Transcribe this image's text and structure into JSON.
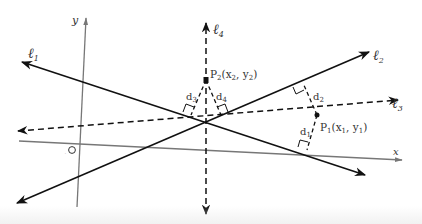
{
  "diagram": {
    "axes": {
      "x_label": "x",
      "y_label": "y",
      "origin_label": "O"
    },
    "lines": [
      {
        "id": "l1",
        "label": "ℓ",
        "sub": "1",
        "style": "solid"
      },
      {
        "id": "l2",
        "label": "ℓ",
        "sub": "2",
        "style": "solid"
      },
      {
        "id": "l3",
        "label": "ℓ",
        "sub": "3",
        "style": "dashed"
      },
      {
        "id": "l4",
        "label": "ℓ",
        "sub": "4",
        "style": "dashed"
      }
    ],
    "points": [
      {
        "id": "P1",
        "name": "P",
        "sub": "1",
        "coords": "(x",
        "xs": "1",
        "mid": ", y",
        "ys": "1",
        "end": ")"
      },
      {
        "id": "P2",
        "name": "P",
        "sub": "2",
        "coords": "(x",
        "xs": "2",
        "mid": ", y",
        "ys": "2",
        "end": ")"
      }
    ],
    "distances": [
      {
        "id": "d1",
        "name": "d",
        "sub": "1"
      },
      {
        "id": "d2",
        "name": "d",
        "sub": "2"
      },
      {
        "id": "d3",
        "name": "d",
        "sub": "3"
      },
      {
        "id": "d4",
        "name": "d",
        "sub": "4"
      }
    ],
    "colors": {
      "line": "#111111",
      "axis": "#777777",
      "text": "#333333"
    }
  }
}
